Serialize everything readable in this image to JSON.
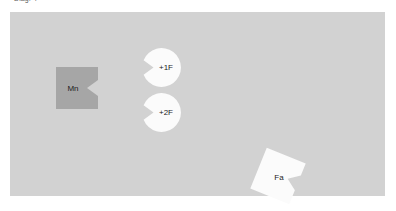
{
  "caption": {
    "text": "Diag. 4"
  },
  "board": {
    "name": "diagram-board",
    "background_color": "#d2d2d2",
    "width": 375,
    "height": 184
  },
  "palette": {
    "page_background": "#ffffff",
    "board_fill": "#d2d2d2",
    "node_gray_fill": "#a6a6a6",
    "node_white_fill": "#fbfbfb",
    "label_color": "#1d1d1d",
    "caption_color": "#5c5c5c"
  },
  "nodes": [
    {
      "id": "mn",
      "label": "Mn",
      "shape": "square-with-right-notch",
      "fill": "#a6a6a6",
      "x": 46,
      "y": 55,
      "width": 42,
      "height": 42,
      "rotation": 0
    },
    {
      "id": "f1",
      "label": "+1F",
      "shape": "circle-with-left-notch",
      "fill": "#fbfbfb",
      "x": 132,
      "y": 35,
      "width": 40,
      "height": 41,
      "rotation": 0
    },
    {
      "id": "f2",
      "label": "+2F",
      "shape": "circle-with-left-notch",
      "fill": "#fbfbfb",
      "x": 132,
      "y": 80,
      "width": 40,
      "height": 41,
      "rotation": 0
    },
    {
      "id": "fa",
      "label": "Fa",
      "shape": "square-with-notch-rotated",
      "fill": "#fbfbfb",
      "x": 243,
      "y": 140,
      "width": 50,
      "height": 48,
      "rotation": 22
    }
  ]
}
